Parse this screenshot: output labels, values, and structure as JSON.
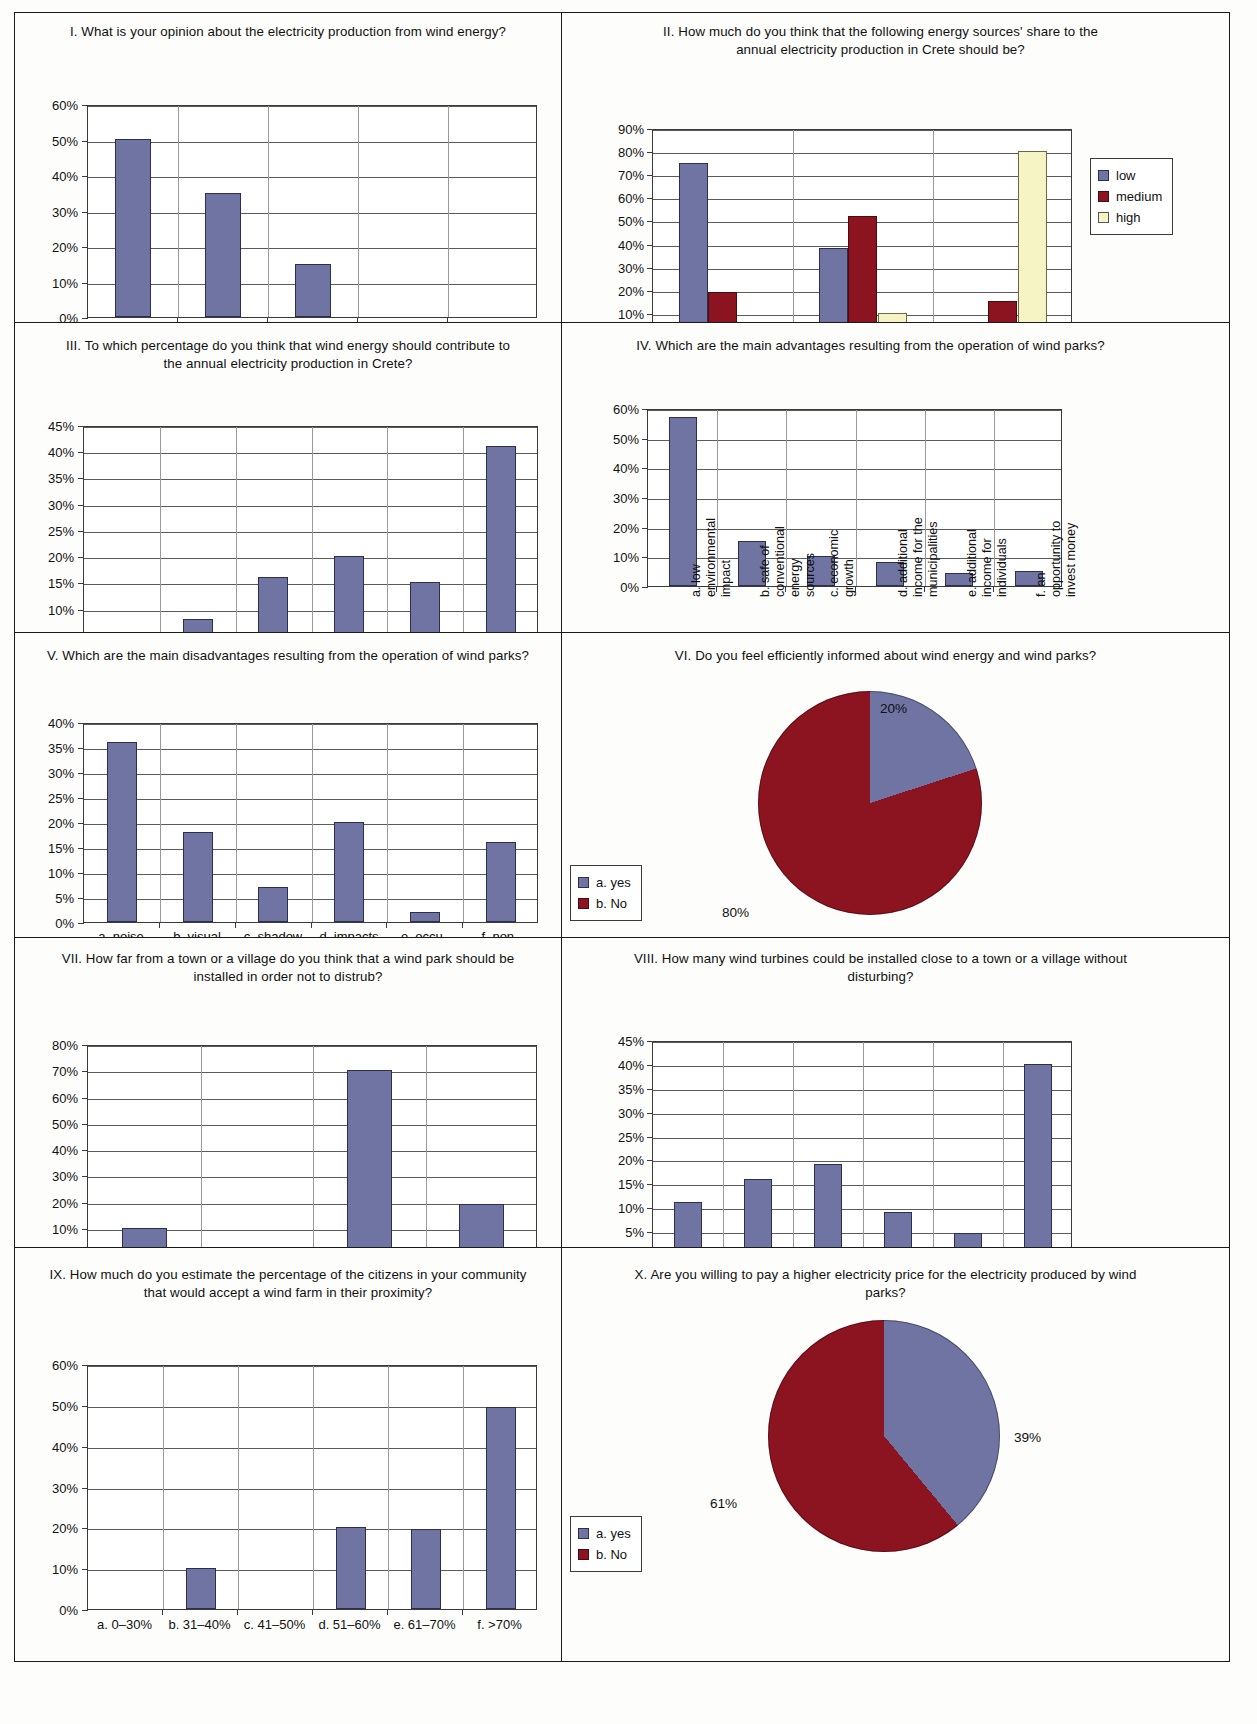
{
  "page": {
    "background": "#fdfdfb",
    "series_colors": {
      "low": "#6f74a3",
      "medium": "#8c1320",
      "high": "#f6f4c4"
    }
  },
  "chart_data": [
    {
      "id": "I",
      "type": "bar",
      "title": "I. What is your opinion about the electricity production from wind energy?",
      "categories": [
        "a. positive",
        "b. almost positive",
        "c. neutral",
        "d. almost negative",
        "e. negative"
      ],
      "values": [
        50,
        35,
        15,
        0,
        0
      ],
      "yticks": [
        "0%",
        "10%",
        "20%",
        "30%",
        "40%",
        "50%",
        "60%"
      ],
      "ylim": [
        0,
        60
      ],
      "xlabel": "",
      "ylabel": "",
      "grid": true,
      "legend": null
    },
    {
      "id": "II",
      "type": "bar",
      "title": "II. How much do you think that the following energy sources' share to the annual electricity production in Crete should be?",
      "categories": [
        "a. nuclear power",
        "b. oil–coal",
        "c. wind energy"
      ],
      "series": [
        {
          "name": "low",
          "values": [
            75,
            38,
            5
          ]
        },
        {
          "name": "medium",
          "values": [
            19,
            52,
            15
          ]
        },
        {
          "name": "high",
          "values": [
            6,
            10,
            80
          ]
        }
      ],
      "yticks": [
        "0%",
        "10%",
        "20%",
        "30%",
        "40%",
        "50%",
        "60%",
        "70%",
        "80%",
        "90%"
      ],
      "ylim": [
        0,
        90
      ],
      "grid": true,
      "legend": {
        "position": "right",
        "entries": [
          "low",
          "medium",
          "high"
        ]
      }
    },
    {
      "id": "III",
      "type": "bar",
      "title": "III. To which percentage do you think that wind energy should contribute to the annual electricity production in Crete?",
      "categories": [
        "a. 0–20%",
        "b. 21–30%",
        "c. 30–40%",
        "d. 41–50%",
        "e. 51–60%",
        "f. >60%"
      ],
      "values": [
        0,
        8,
        16,
        20,
        15,
        41
      ],
      "yticks": [
        "0%",
        "5%",
        "10%",
        "15%",
        "20%",
        "25%",
        "30%",
        "35%",
        "40%",
        "45%"
      ],
      "ylim": [
        0,
        45
      ],
      "grid": true,
      "legend": null
    },
    {
      "id": "IV",
      "type": "bar",
      "title": "IV. Which are the main advantages resulting from the operation of wind parks?",
      "categories": [
        "a. low\nenvironmental\nimpact",
        "b. safe of\nconventional\nenergy\nsources",
        "c. economic\ngrowth",
        "d. additional\nincome for the\nmunicipalities",
        "e. additional\nincome for\nindividuals",
        "f. an\nopportunity to\ninvest money"
      ],
      "values": [
        57,
        15,
        10,
        8,
        4.5,
        5
      ],
      "yticks": [
        "0%",
        "10%",
        "20%",
        "30%",
        "40%",
        "50%",
        "60%"
      ],
      "ylim": [
        0,
        60
      ],
      "grid": true,
      "rotated_labels": true,
      "legend": null
    },
    {
      "id": "V",
      "type": "bar",
      "title": "V. Which are the main disadvantages resulting from the operation of wind parks?",
      "categories": [
        "a. noise\nemissions",
        "b. visual\nimpacts",
        "c. shadow\nflicker",
        "d. impacts\non birds",
        "e. occu-\npation\nof land",
        "f. non-\nguaranteed\nproduction"
      ],
      "values": [
        36,
        18,
        7,
        20,
        2,
        16
      ],
      "yticks": [
        "0%",
        "5%",
        "10%",
        "15%",
        "20%",
        "25%",
        "30%",
        "35%",
        "40%"
      ],
      "ylim": [
        0,
        40
      ],
      "grid": true,
      "legend": null
    },
    {
      "id": "VI",
      "type": "pie",
      "title": "VI. Do you feel efficiently informed about wind energy and wind parks?",
      "labels": [
        "a. yes",
        "b. No"
      ],
      "values": [
        20,
        80
      ],
      "value_labels": [
        "20%",
        "80%"
      ],
      "legend": {
        "position": "bottom-left",
        "entries": [
          "a. yes",
          "b. No"
        ]
      }
    },
    {
      "id": "VII",
      "type": "bar",
      "title": "VII. How far from a town or a village do you think that a wind park should be installed in order not to distrub?",
      "categories": [
        "b. 800 m",
        "b. 1.600 m",
        "c. 3.000 m",
        "d. >3.000 m"
      ],
      "values": [
        10,
        0,
        70,
        19
      ],
      "yticks": [
        "0%",
        "10%",
        "20%",
        "30%",
        "40%",
        "50%",
        "60%",
        "70%",
        "80%"
      ],
      "ylim": [
        0,
        80
      ],
      "grid": true,
      "legend": null
    },
    {
      "id": "VIII",
      "type": "bar",
      "title": "VIII. How many wind turbines could be installed close to a town or a village without disturbing?",
      "categories": [
        "a. 1–4",
        "b. 5–10",
        "c. 11–15",
        "d. 16–20",
        "e. 21–30",
        "f. as many as possible"
      ],
      "values": [
        11,
        16,
        19,
        9,
        4.5,
        40
      ],
      "yticks": [
        "0%",
        "5%",
        "10%",
        "15%",
        "20%",
        "25%",
        "30%",
        "35%",
        "40%",
        "45%"
      ],
      "ylim": [
        0,
        45
      ],
      "grid": true,
      "legend": null
    },
    {
      "id": "IX",
      "type": "bar",
      "title": "IX. How much do you estimate the percentage of the citizens in your community that would accept a wind farm in their proximity?",
      "categories": [
        "a. 0–30%",
        "b. 31–40%",
        "c. 41–50%",
        "d. 51–60%",
        "e. 61–70%",
        "f. >70%"
      ],
      "values": [
        0,
        10,
        0,
        20,
        19.5,
        49.5
      ],
      "yticks": [
        "0%",
        "10%",
        "20%",
        "30%",
        "40%",
        "50%",
        "60%"
      ],
      "ylim": [
        0,
        60
      ],
      "grid": true,
      "legend": null
    },
    {
      "id": "X",
      "type": "pie",
      "title": "X. Are you willing to pay a higher electricity price for the electricity produced by wind parks?",
      "labels": [
        "a. yes",
        "b. No"
      ],
      "values": [
        39,
        61
      ],
      "value_labels": [
        "39%",
        "61%"
      ],
      "legend": {
        "position": "bottom-left",
        "entries": [
          "a. yes",
          "b. No"
        ]
      }
    }
  ]
}
